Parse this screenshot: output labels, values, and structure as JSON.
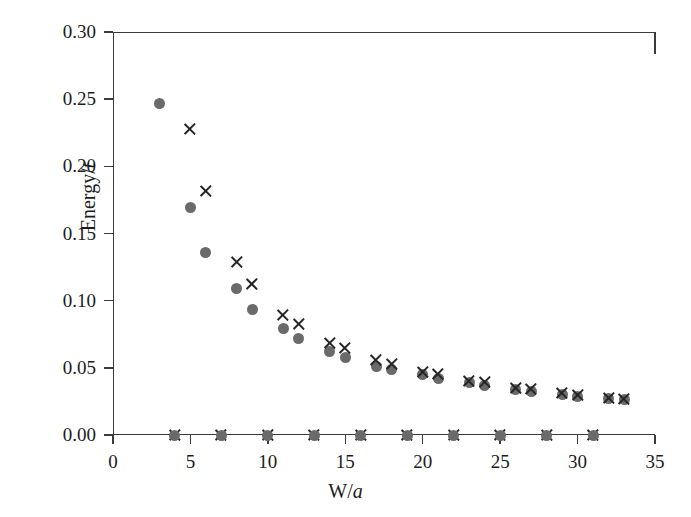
{
  "chart_data": {
    "type": "scatter",
    "title": "",
    "xlabel": "W/a",
    "ylabel": "Energy/t",
    "xlim": [
      0,
      35
    ],
    "ylim": [
      0.0,
      0.3
    ],
    "xticks": [
      0,
      5,
      10,
      15,
      20,
      25,
      30,
      35
    ],
    "xtick_labels": [
      "0",
      "5",
      "10",
      "15",
      "20",
      "25",
      "30",
      "35"
    ],
    "yticks": [
      0.0,
      0.05,
      0.1,
      0.15,
      0.2,
      0.25,
      0.3
    ],
    "ytick_labels": [
      "0.00",
      "0.05",
      "0.10",
      "0.15",
      "0.20",
      "0.25",
      "0.30"
    ],
    "grid": false,
    "legend": "none",
    "series": [
      {
        "name": "circle-series",
        "marker": "filled-circle",
        "color": "#6a6a6a",
        "points": [
          {
            "x": 3.0,
            "y": 0.2465
          },
          {
            "x": 5.0,
            "y": 0.169
          },
          {
            "x": 6.0,
            "y": 0.1355
          },
          {
            "x": 8.0,
            "y": 0.1088
          },
          {
            "x": 9.0,
            "y": 0.0935
          },
          {
            "x": 11.0,
            "y": 0.0795
          },
          {
            "x": 12.0,
            "y": 0.072
          },
          {
            "x": 14.0,
            "y": 0.0625
          },
          {
            "x": 15.0,
            "y": 0.0575
          },
          {
            "x": 17.0,
            "y": 0.051
          },
          {
            "x": 18.0,
            "y": 0.0485
          },
          {
            "x": 20.0,
            "y": 0.0448
          },
          {
            "x": 21.0,
            "y": 0.042
          },
          {
            "x": 23.0,
            "y": 0.0388
          },
          {
            "x": 24.0,
            "y": 0.0365
          },
          {
            "x": 26.0,
            "y": 0.0338
          },
          {
            "x": 27.0,
            "y": 0.0323
          },
          {
            "x": 29.0,
            "y": 0.03
          },
          {
            "x": 30.0,
            "y": 0.0288
          },
          {
            "x": 32.0,
            "y": 0.0272
          },
          {
            "x": 33.0,
            "y": 0.0262
          }
        ]
      },
      {
        "name": "cross-series",
        "marker": "x-cross",
        "color": "#262626",
        "points": [
          {
            "x": 5.0,
            "y": 0.2275
          },
          {
            "x": 6.0,
            "y": 0.1815
          },
          {
            "x": 8.0,
            "y": 0.129
          },
          {
            "x": 9.0,
            "y": 0.1125
          },
          {
            "x": 11.0,
            "y": 0.0895
          },
          {
            "x": 12.0,
            "y": 0.083
          },
          {
            "x": 14.0,
            "y": 0.0682
          },
          {
            "x": 15.0,
            "y": 0.0648
          },
          {
            "x": 17.0,
            "y": 0.0558
          },
          {
            "x": 18.0,
            "y": 0.0532
          },
          {
            "x": 20.0,
            "y": 0.047
          },
          {
            "x": 21.0,
            "y": 0.0452
          },
          {
            "x": 23.0,
            "y": 0.0405
          },
          {
            "x": 24.0,
            "y": 0.0392
          },
          {
            "x": 26.0,
            "y": 0.0352
          },
          {
            "x": 27.0,
            "y": 0.0342
          },
          {
            "x": 29.0,
            "y": 0.031
          },
          {
            "x": 30.0,
            "y": 0.03
          },
          {
            "x": 32.0,
            "y": 0.0278
          },
          {
            "x": 33.0,
            "y": 0.027
          },
          {
            "x": 4.0,
            "y": 0.0
          },
          {
            "x": 7.0,
            "y": 0.0
          },
          {
            "x": 10.0,
            "y": 0.0
          },
          {
            "x": 13.0,
            "y": 0.0
          },
          {
            "x": 16.0,
            "y": 0.0
          },
          {
            "x": 19.0,
            "y": 0.0
          },
          {
            "x": 22.0,
            "y": 0.0
          },
          {
            "x": 25.0,
            "y": 0.0
          },
          {
            "x": 28.0,
            "y": 0.0
          },
          {
            "x": 31.0,
            "y": 0.0
          }
        ]
      },
      {
        "name": "zero-circle-series",
        "marker": "filled-circle",
        "color": "#6a6a6a",
        "points": [
          {
            "x": 4.0,
            "y": 0.0
          },
          {
            "x": 7.0,
            "y": 0.0
          },
          {
            "x": 10.0,
            "y": 0.0
          },
          {
            "x": 13.0,
            "y": 0.0
          },
          {
            "x": 16.0,
            "y": 0.0
          },
          {
            "x": 19.0,
            "y": 0.0
          },
          {
            "x": 22.0,
            "y": 0.0
          },
          {
            "x": 25.0,
            "y": 0.0
          },
          {
            "x": 28.0,
            "y": 0.0
          },
          {
            "x": 31.0,
            "y": 0.0
          }
        ]
      }
    ]
  }
}
